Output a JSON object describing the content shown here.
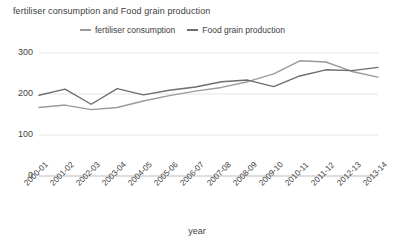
{
  "chart_data": {
    "type": "line",
    "title": "fertiliser consumption and Food grain production",
    "xlabel": "year",
    "ylabel": "",
    "categories": [
      "2000-01",
      "2001-02",
      "2002-03",
      "2003-04",
      "2004-05",
      "2005-06",
      "2006-07",
      "2007-08",
      "2008-09",
      "2009-10",
      "2010-11",
      "2011-12",
      "2012-13",
      "2013-14"
    ],
    "series": [
      {
        "name": "fertiliser consumption",
        "color": "#9a9a9a",
        "values": [
          167,
          173,
          162,
          167,
          183,
          196,
          207,
          216,
          230,
          249,
          281,
          278,
          255,
          241
        ]
      },
      {
        "name": "Food grain production",
        "color": "#6e6e6e",
        "values": [
          197,
          212,
          175,
          213,
          198,
          209,
          217,
          230,
          234,
          218,
          244,
          259,
          257,
          265
        ]
      }
    ],
    "ylim": [
      0,
      300
    ],
    "yticks": [
      0,
      100,
      200,
      300
    ],
    "ytick_labels": [
      "0",
      "100",
      "200",
      "300"
    ],
    "grid": true,
    "grid_color": "#e4e4e4",
    "legend_position": "top-center",
    "background": "#ffffff"
  },
  "legend": {
    "entries": [
      {
        "label": "fertiliser consumption",
        "marker": "line-dash-icon"
      },
      {
        "label": "Food grain production",
        "marker": "line-dash-icon"
      }
    ]
  }
}
